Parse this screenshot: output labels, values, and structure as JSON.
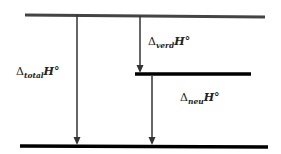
{
  "diagram": {
    "type": "enthalpy-level-diagram",
    "colors": {
      "top_level": "#444444",
      "levels": "#000000",
      "arrows": "#333333",
      "text": "#222222"
    },
    "levels": [
      {
        "id": "top",
        "x1": 25,
        "y1": 15,
        "x2": 265,
        "y2": 17,
        "width": 3
      },
      {
        "id": "middle",
        "x1": 135,
        "y1": 74,
        "x2": 251,
        "y2": 74,
        "width": 3.5
      },
      {
        "id": "bottom",
        "x1": 20,
        "y1": 146,
        "x2": 268,
        "y2": 147,
        "width": 3.5
      }
    ],
    "arrows": [
      {
        "id": "total",
        "x": 77,
        "y1": 15,
        "y2": 144
      },
      {
        "id": "verd",
        "x": 140,
        "y1": 16,
        "y2": 72
      },
      {
        "id": "neu",
        "x": 152,
        "y1": 76,
        "y2": 144
      }
    ],
    "labels": {
      "total": {
        "delta": "Δ",
        "sub": "total",
        "sym": "H°"
      },
      "verd": {
        "delta": "Δ",
        "sub": "verd",
        "sym": "H°"
      },
      "neu": {
        "delta": "Δ",
        "sub": "neu",
        "sym": "H°"
      }
    }
  }
}
